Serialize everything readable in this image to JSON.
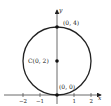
{
  "diagram": {
    "axes": {
      "x_label": "x",
      "y_label": "y",
      "x_ticks": [
        "−2",
        "−1",
        "1",
        "2"
      ]
    },
    "points": {
      "top": "(0, 4)",
      "center": "C(0, 2)",
      "origin": "(0, 0)"
    },
    "colors": {
      "stroke": "#222222",
      "background": "#ffffff"
    }
  }
}
